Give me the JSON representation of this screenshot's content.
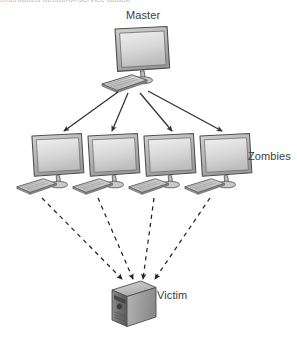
{
  "diagram": {
    "title_strip": "Distributed denial-of-service attack",
    "background_color": "#ffffff",
    "line_color": "#3b3b3b",
    "device_fill_light": "#e6e6e6",
    "device_fill_mid": "#c3c3c3",
    "device_fill_dark": "#8f8f8f",
    "device_stroke": "#5a5a5a",
    "nodes": [
      {
        "id": "master",
        "label": "Master",
        "device": "desktop-monitor-keyboard",
        "tier": "top",
        "count": 1
      },
      {
        "id": "zombies",
        "label": "Zombies",
        "device": "desktop-monitor-keyboard",
        "tier": "middle",
        "count": 4
      },
      {
        "id": "victim",
        "label": "Victim",
        "device": "server-tower",
        "tier": "bottom",
        "count": 1
      }
    ],
    "edges": [
      {
        "id": "master-to-zombies",
        "from": "master",
        "to": "zombies",
        "style": "solid",
        "arrow": "end",
        "count": 4
      },
      {
        "id": "zombies-to-victim",
        "from": "zombies",
        "to": "victim",
        "style": "dashed",
        "arrow": "end",
        "count": 4
      }
    ]
  }
}
